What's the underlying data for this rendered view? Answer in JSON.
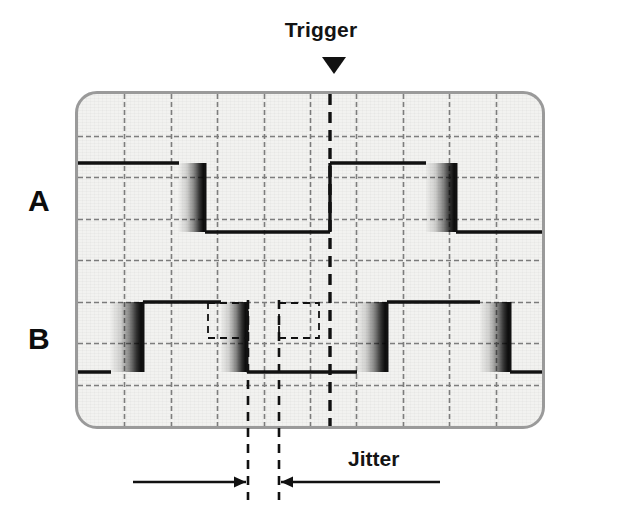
{
  "annotations": {
    "trigger_label": "Trigger",
    "trigger_marker_icon": "triangle-down-icon",
    "jitter_label": "Jitter",
    "jitter_arrow_left_icon": "arrow-right-icon",
    "jitter_arrow_right_icon": "arrow-left-icon"
  },
  "channels": [
    {
      "id": "A",
      "label": "A"
    },
    {
      "id": "B",
      "label": "B"
    }
  ],
  "colors": {
    "background": "#ffffff",
    "screen_fill": "#f2f2f0",
    "screen_border": "#9a9a9a",
    "grid_line": "#7e7e7e",
    "trace": "#111111",
    "cursor": "#111111",
    "text": "#141414"
  },
  "chart_data": {
    "type": "line",
    "xlabel": "",
    "ylabel": "",
    "grid": true,
    "legend": false,
    "screen": {
      "x0": 78,
      "y0": 94,
      "x1": 542,
      "y1": 426,
      "divisions_x": 10,
      "divisions_y": 8
    },
    "trigger": {
      "x": 330,
      "label": "Trigger",
      "line_style": "dashed",
      "channel": "A",
      "edge": "rising"
    },
    "cursors": [
      {
        "name": "jitter-cursor-left",
        "x": 248,
        "style": "dashed"
      },
      {
        "name": "jitter-cursor-right",
        "x": 279,
        "style": "dashed"
      }
    ],
    "jitter_window": {
      "x_start": 248,
      "x_end": 279,
      "label": "Jitter"
    },
    "series": [
      {
        "name": "A",
        "y_high": 163,
        "y_low": 232,
        "start_level": "high",
        "edges": [
          {
            "x": 205,
            "type": "falling",
            "blur": 26,
            "jitter": true
          },
          {
            "x": 330,
            "type": "rising",
            "blur": 0,
            "jitter": false
          },
          {
            "x": 456,
            "type": "falling",
            "blur": 30,
            "jitter": true
          }
        ]
      },
      {
        "name": "B",
        "y_high": 302,
        "y_low": 372,
        "start_level": "low",
        "edges": [
          {
            "x": 143,
            "type": "rising",
            "blur": 32,
            "jitter": true
          },
          {
            "x": 247,
            "type": "falling",
            "blur": 26,
            "jitter": true
          },
          {
            "x": 387,
            "type": "rising",
            "blur": 30,
            "jitter": true
          },
          {
            "x": 510,
            "type": "falling",
            "blur": 30,
            "jitter": true
          }
        ]
      }
    ]
  }
}
